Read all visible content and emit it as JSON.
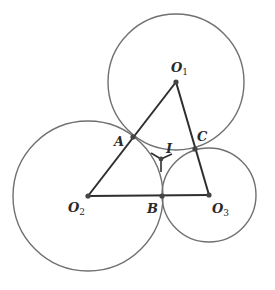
{
  "diagram": {
    "type": "geometry",
    "colors": {
      "stroke": "#3a3a3a",
      "circle": "#6e6e6e",
      "background": "#ffffff"
    },
    "circles": [
      {
        "id": "circle-o1",
        "center": "O1",
        "cx": 176,
        "cy": 82,
        "r": 68
      },
      {
        "id": "circle-o2",
        "center": "O2",
        "cx": 88,
        "cy": 196,
        "r": 75
      },
      {
        "id": "circle-o3",
        "center": "O3",
        "cx": 209,
        "cy": 195,
        "r": 47
      }
    ],
    "points": {
      "O1": {
        "x": 176,
        "y": 82
      },
      "O2": {
        "x": 88,
        "y": 196
      },
      "O3": {
        "x": 209,
        "y": 195
      },
      "A": {
        "x": 133,
        "y": 137
      },
      "B": {
        "x": 162,
        "y": 196
      },
      "C": {
        "x": 195,
        "y": 149
      },
      "I": {
        "x": 161,
        "y": 159
      }
    },
    "segments": [
      "O1-O2",
      "O2-O3",
      "O3-O1",
      "I-A",
      "I-B",
      "I-C"
    ]
  },
  "labels": {
    "O1": {
      "main": "O",
      "sub": "1"
    },
    "O2": {
      "main": "O",
      "sub": "2"
    },
    "O3": {
      "main": "O",
      "sub": "3"
    },
    "A": "A",
    "B": "B",
    "C": "C",
    "I": "I"
  }
}
